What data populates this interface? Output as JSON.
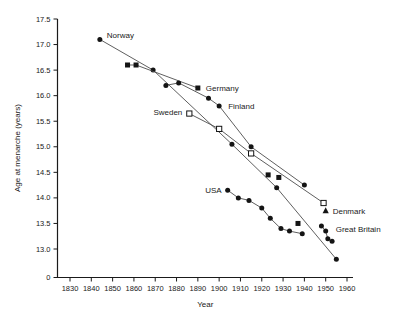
{
  "figure": {
    "x_axis_label": "Year",
    "y_axis_label": "Age at menarche (years)"
  },
  "chart_data": {
    "type": "line",
    "title": "",
    "xlabel": "Year",
    "ylabel": "Age at menarche (years)",
    "x_ticks": [
      1830,
      1840,
      1850,
      1860,
      1870,
      1880,
      1890,
      1900,
      1910,
      1920,
      1930,
      1940,
      1950,
      1960
    ],
    "y_ticks": [
      "17.5",
      "17.0",
      "16.5",
      "16.0",
      "15.5",
      "15.0",
      "14.5",
      "14.0",
      "13.5",
      "13.0"
    ],
    "y_zero_label": "0",
    "x_range_years": [
      1830,
      1960
    ],
    "y_range_values": [
      13.0,
      17.5
    ],
    "axis_broken_at_zero": true,
    "grid": false,
    "legend_position": "inline-labels",
    "colors": {
      "background": "#ffffff",
      "line": "#4d4d4d",
      "marker": "#141414",
      "axis": "#1a1a1a",
      "text": "#1a1a1a"
    },
    "series": [
      {
        "name": "Norway",
        "label": "Norway",
        "marker": "circle",
        "line": true,
        "label_at": 0,
        "label_dx": 7,
        "label_dy": -4,
        "label_anchor": "start",
        "points": [
          [
            1844,
            17.1
          ],
          [
            1869,
            16.5
          ],
          [
            1906,
            15.05
          ],
          [
            1927,
            14.2
          ],
          [
            1955,
            12.8
          ]
        ]
      },
      {
        "name": "Germany",
        "label": "Germany",
        "marker": "square",
        "line": true,
        "line_points": 3,
        "label_at": 2,
        "label_dx": 8,
        "label_dy": 0,
        "label_anchor": "start",
        "points": [
          [
            1857,
            16.6
          ],
          [
            1861,
            16.6
          ],
          [
            1890,
            16.15
          ],
          [
            1923,
            14.45
          ],
          [
            1928,
            14.4
          ],
          [
            1937,
            13.5
          ]
        ]
      },
      {
        "name": "Finland",
        "label": "Finland",
        "marker": "circle",
        "line": true,
        "label_at": 3,
        "label_dx": 9,
        "label_dy": 1,
        "label_anchor": "start",
        "points": [
          [
            1875,
            16.2
          ],
          [
            1881,
            16.25
          ],
          [
            1895,
            15.95
          ],
          [
            1900,
            15.8
          ],
          [
            1915,
            15.0
          ],
          [
            1940,
            14.25
          ]
        ]
      },
      {
        "name": "Sweden",
        "label": "Sweden",
        "marker": "open-square",
        "line": true,
        "label_at": 0,
        "label_dx": -7,
        "label_dy": -1,
        "label_anchor": "end",
        "points": [
          [
            1886,
            15.65
          ],
          [
            1900,
            15.35
          ],
          [
            1915,
            14.87
          ],
          [
            1949,
            13.9
          ]
        ]
      },
      {
        "name": "USA",
        "label": "USA",
        "marker": "circle",
        "line": true,
        "label_at": 0,
        "label_dx": -6,
        "label_dy": 0,
        "label_anchor": "end",
        "points": [
          [
            1904,
            14.15
          ],
          [
            1909,
            14.0
          ],
          [
            1914,
            13.95
          ],
          [
            1920,
            13.8
          ],
          [
            1924,
            13.6
          ],
          [
            1929,
            13.4
          ],
          [
            1933,
            13.35
          ],
          [
            1939,
            13.3
          ]
        ]
      },
      {
        "name": "Denmark",
        "label": "Denmark",
        "marker": "triangle",
        "line": false,
        "label_at": 0,
        "label_dx": 7,
        "label_dy": 1,
        "label_anchor": "start",
        "points": [
          [
            1950,
            13.75
          ]
        ]
      },
      {
        "name": "Great Britain",
        "label": "Great Britain",
        "marker": "circle",
        "line": true,
        "label_at": 1,
        "label_dx": 10,
        "label_dy": -2,
        "label_anchor": "start",
        "points": [
          [
            1948,
            13.45
          ],
          [
            1950,
            13.35
          ],
          [
            1951,
            13.2
          ],
          [
            1953,
            13.15
          ]
        ]
      }
    ]
  }
}
